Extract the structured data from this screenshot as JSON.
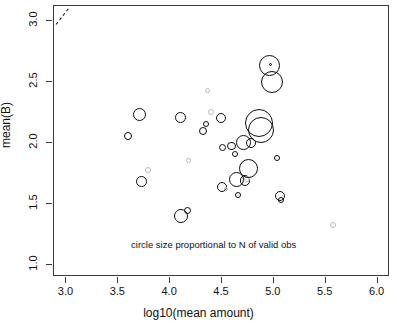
{
  "chart_data": {
    "type": "scatter",
    "title": "",
    "xlabel": "log10(mean amount)",
    "ylabel": "mean(B)",
    "xlim": [
      2.88,
      6.12
    ],
    "ylim": [
      0.9,
      3.12
    ],
    "xticks": [
      3.0,
      3.5,
      4.0,
      4.5,
      5.0,
      5.5,
      6.0
    ],
    "xticklabels": [
      "3.0",
      "3.5",
      "4.0",
      "4.5",
      "5.0",
      "5.5",
      "6.0"
    ],
    "yticks": [
      1.0,
      1.5,
      2.0,
      2.5,
      3.0
    ],
    "yticklabels": [
      "1.0",
      "1.5",
      "2.0",
      "2.5",
      "3.0"
    ],
    "grid": false,
    "legend": null,
    "annotations": [
      {
        "text": "circle size proportional to N of valid obs",
        "x": 4.42,
        "y": 1.16
      }
    ],
    "reference_line": {
      "style": "dashed",
      "x0": 2.9,
      "y0": 2.97,
      "x1": 3.02,
      "y1": 3.1
    },
    "size_encoding": "circle size proportional to N of valid obs",
    "points": [
      {
        "x": 3.595,
        "y": 2.057,
        "r": 4.0,
        "faint": false
      },
      {
        "x": 3.705,
        "y": 2.235,
        "r": 6.5,
        "faint": false
      },
      {
        "x": 3.725,
        "y": 1.683,
        "r": 5.5,
        "faint": false
      },
      {
        "x": 3.785,
        "y": 1.775,
        "r": 3.0,
        "faint": true
      },
      {
        "x": 4.095,
        "y": 2.205,
        "r": 5.5,
        "faint": false
      },
      {
        "x": 4.105,
        "y": 1.397,
        "r": 7.0,
        "faint": false
      },
      {
        "x": 4.165,
        "y": 1.448,
        "r": 3.5,
        "faint": false
      },
      {
        "x": 4.175,
        "y": 1.858,
        "r": 2.5,
        "faint": true
      },
      {
        "x": 4.32,
        "y": 2.098,
        "r": 4.0,
        "faint": false
      },
      {
        "x": 4.345,
        "y": 2.155,
        "r": 3.2,
        "faint": false
      },
      {
        "x": 4.36,
        "y": 2.43,
        "r": 2.5,
        "faint": true
      },
      {
        "x": 4.395,
        "y": 2.25,
        "r": 2.8,
        "faint": true
      },
      {
        "x": 4.49,
        "y": 2.205,
        "r": 5.0,
        "faint": false
      },
      {
        "x": 4.505,
        "y": 1.962,
        "r": 3.5,
        "faint": false
      },
      {
        "x": 4.5,
        "y": 1.64,
        "r": 5.0,
        "faint": false
      },
      {
        "x": 4.535,
        "y": 1.62,
        "r": 2.0,
        "faint": true
      },
      {
        "x": 4.59,
        "y": 1.975,
        "r": 4.2,
        "faint": false
      },
      {
        "x": 4.625,
        "y": 1.905,
        "r": 3.0,
        "faint": false
      },
      {
        "x": 4.635,
        "y": 1.7,
        "r": 7.5,
        "faint": false
      },
      {
        "x": 4.655,
        "y": 1.57,
        "r": 3.0,
        "faint": false
      },
      {
        "x": 4.705,
        "y": 2.0,
        "r": 7.5,
        "faint": false
      },
      {
        "x": 4.72,
        "y": 1.692,
        "r": 5.2,
        "faint": false
      },
      {
        "x": 4.745,
        "y": 1.7,
        "r": 3.0,
        "faint": true
      },
      {
        "x": 4.755,
        "y": 1.79,
        "r": 9.5,
        "faint": false
      },
      {
        "x": 4.78,
        "y": 2.0,
        "r": 5.0,
        "faint": false
      },
      {
        "x": 4.855,
        "y": 2.165,
        "r": 14.0,
        "faint": false
      },
      {
        "x": 4.88,
        "y": 2.105,
        "r": 13.0,
        "faint": false
      },
      {
        "x": 4.96,
        "y": 2.635,
        "r": 10.5,
        "faint": false
      },
      {
        "x": 4.965,
        "y": 2.64,
        "r": 1.6,
        "faint": false
      },
      {
        "x": 4.98,
        "y": 2.5,
        "r": 11.0,
        "faint": false
      },
      {
        "x": 5.035,
        "y": 1.872,
        "r": 3.0,
        "faint": false
      },
      {
        "x": 5.06,
        "y": 1.565,
        "r": 5.0,
        "faint": false
      },
      {
        "x": 5.065,
        "y": 1.53,
        "r": 3.0,
        "faint": false
      },
      {
        "x": 5.57,
        "y": 1.33,
        "r": 3.0,
        "faint": true
      }
    ]
  }
}
